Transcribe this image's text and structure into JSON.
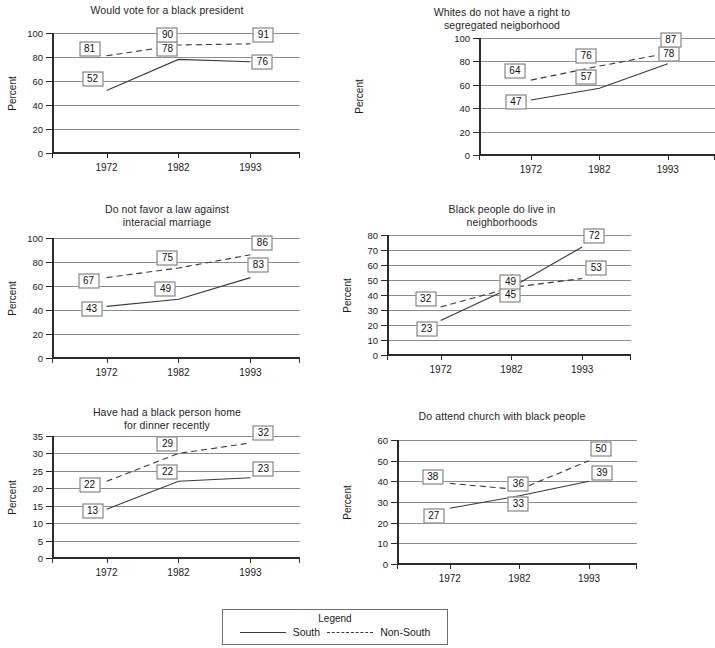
{
  "legend": {
    "title": "Legend",
    "south_label": "South",
    "nonsouth_label": "Non-South",
    "south_style": "solid",
    "nonsouth_style": "dashed"
  },
  "shared": {
    "ylabel": "Percent",
    "categories": [
      "1972",
      "1982",
      "1993"
    ],
    "series_names": [
      "South",
      "Non-South"
    ],
    "grid": true,
    "line_color": "#3a3a3a",
    "grid_color": "#8c8c8c",
    "axis_color": "#2b2b2b"
  },
  "chart_data": [
    {
      "type": "line",
      "title": "Would vote for a black president",
      "xlabel": "",
      "ylabel": "Percent",
      "categories": [
        "1972",
        "1982",
        "1993"
      ],
      "ylim": [
        0,
        100
      ],
      "yticks": [
        0,
        20,
        40,
        60,
        80,
        100
      ],
      "grid": true,
      "legend_position": "external-bottom",
      "series": [
        {
          "name": "South",
          "style": "solid",
          "values": [
            52,
            78,
            76
          ]
        },
        {
          "name": "Non-South",
          "style": "dashed",
          "values": [
            81,
            90,
            91
          ]
        }
      ],
      "labels": [
        {
          "text": "52",
          "series": "South",
          "x": 0
        },
        {
          "text": "78",
          "series": "South",
          "x": 1
        },
        {
          "text": "76",
          "series": "South",
          "x": 2
        },
        {
          "text": "81",
          "series": "Non-South",
          "x": 0
        },
        {
          "text": "90",
          "series": "Non-South",
          "x": 1
        },
        {
          "text": "91",
          "series": "Non-South",
          "x": 2
        }
      ]
    },
    {
      "type": "line",
      "title": "Whites do not have a right to\nsegregated neigborhood",
      "xlabel": "",
      "ylabel": "Percent",
      "categories": [
        "1972",
        "1982",
        "1993"
      ],
      "ylim": [
        0,
        100
      ],
      "yticks": [
        0,
        20,
        40,
        60,
        80,
        100
      ],
      "grid": true,
      "legend_position": "external-bottom",
      "series": [
        {
          "name": "South",
          "style": "solid",
          "values": [
            47,
            57,
            78
          ]
        },
        {
          "name": "Non-South",
          "style": "dashed",
          "values": [
            64,
            76,
            87
          ]
        }
      ],
      "labels": [
        {
          "text": "47",
          "series": "South",
          "x": 0
        },
        {
          "text": "57",
          "series": "South",
          "x": 1
        },
        {
          "text": "78",
          "series": "South",
          "x": 2
        },
        {
          "text": "64",
          "series": "Non-South",
          "x": 0
        },
        {
          "text": "76",
          "series": "Non-South",
          "x": 1
        },
        {
          "text": "87",
          "series": "Non-South",
          "x": 2
        }
      ]
    },
    {
      "type": "line",
      "title": "Do not favor a law against\ninteracial marriage",
      "xlabel": "",
      "ylabel": "Percent",
      "categories": [
        "1972",
        "1982",
        "1993"
      ],
      "ylim": [
        0,
        100
      ],
      "yticks": [
        0,
        20,
        40,
        60,
        80,
        100
      ],
      "grid": true,
      "legend_position": "external-bottom",
      "series": [
        {
          "name": "South",
          "style": "solid",
          "values": [
            43,
            49,
            67
          ]
        },
        {
          "name": "Non-South",
          "style": "dashed",
          "values": [
            67,
            75,
            86
          ]
        }
      ],
      "labels": [
        {
          "text": "43",
          "series": "South",
          "x": 0
        },
        {
          "text": "49",
          "series": "South",
          "x": 1
        },
        {
          "text": "83",
          "series": "South",
          "x": 2
        },
        {
          "text": "67",
          "series": "Non-South",
          "x": 0
        },
        {
          "text": "75",
          "series": "Non-South",
          "x": 1
        },
        {
          "text": "86",
          "series": "Non-South",
          "x": 2
        }
      ]
    },
    {
      "type": "line",
      "title": "Black people do live in\nneighborhoods",
      "xlabel": "",
      "ylabel": "Percent",
      "categories": [
        "1972",
        "1982",
        "1993"
      ],
      "ylim": [
        0,
        80
      ],
      "yticks": [
        0,
        10,
        20,
        30,
        40,
        50,
        60,
        70,
        80
      ],
      "grid": true,
      "legend_position": "external-bottom",
      "series": [
        {
          "name": "South",
          "style": "solid",
          "values": [
            23,
            45,
            72
          ]
        },
        {
          "name": "Non-South",
          "style": "dashed",
          "values": [
            32,
            45,
            51
          ]
        }
      ],
      "labels": [
        {
          "text": "23",
          "series": "South",
          "x": 0
        },
        {
          "text": "45",
          "series": "South",
          "x": 1
        },
        {
          "text": "72",
          "series": "South",
          "x": 2
        },
        {
          "text": "32",
          "series": "Non-South",
          "x": 0
        },
        {
          "text": "49",
          "series": "Non-South",
          "x": 1
        },
        {
          "text": "53",
          "series": "Non-South",
          "x": 2
        }
      ]
    },
    {
      "type": "line",
      "title": "Have had a black person home\nfor dinner recently",
      "xlabel": "",
      "ylabel": "Percent",
      "categories": [
        "1972",
        "1982",
        "1993"
      ],
      "ylim": [
        0,
        35
      ],
      "yticks": [
        0,
        5,
        10,
        15,
        20,
        25,
        30,
        35
      ],
      "grid": true,
      "legend_position": "external-bottom",
      "series": [
        {
          "name": "South",
          "style": "solid",
          "values": [
            14,
            22,
            23
          ]
        },
        {
          "name": "Non-South",
          "style": "dashed",
          "values": [
            22,
            30,
            33
          ]
        }
      ],
      "labels": [
        {
          "text": "13",
          "series": "South",
          "x": 0
        },
        {
          "text": "22",
          "series": "South",
          "x": 1
        },
        {
          "text": "23",
          "series": "South",
          "x": 2
        },
        {
          "text": "22",
          "series": "Non-South",
          "x": 0
        },
        {
          "text": "29",
          "series": "Non-South",
          "x": 1
        },
        {
          "text": "32",
          "series": "Non-South",
          "x": 2
        }
      ]
    },
    {
      "type": "line",
      "title": "Do attend church with black people",
      "xlabel": "",
      "ylabel": "Percent",
      "categories": [
        "1972",
        "1982",
        "1993"
      ],
      "ylim": [
        0,
        60
      ],
      "yticks": [
        0,
        10,
        20,
        30,
        40,
        50,
        60
      ],
      "grid": true,
      "legend_position": "external-bottom",
      "series": [
        {
          "name": "South",
          "style": "solid",
          "values": [
            27,
            33,
            40
          ]
        },
        {
          "name": "Non-South",
          "style": "dashed",
          "values": [
            39,
            36,
            50
          ]
        }
      ],
      "labels": [
        {
          "text": "27",
          "series": "South",
          "x": 0
        },
        {
          "text": "33",
          "series": "South",
          "x": 1
        },
        {
          "text": "39",
          "series": "South",
          "x": 2
        },
        {
          "text": "38",
          "series": "Non-South",
          "x": 0
        },
        {
          "text": "36",
          "series": "Non-South",
          "x": 1
        },
        {
          "text": "50",
          "series": "Non-South",
          "x": 2
        }
      ]
    }
  ]
}
